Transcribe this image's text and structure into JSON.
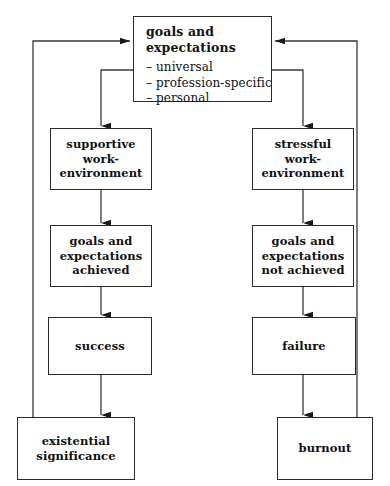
{
  "diagram": {
    "type": "flowchart",
    "width": 390,
    "height": 486,
    "colors": {
      "stroke": "#2a2a2a",
      "text": "#111111",
      "background": "#ffffff"
    },
    "nodes": [
      {
        "id": "goals-expectations",
        "title": "goals and expectations",
        "bullets": [
          "– universal",
          "– profession-specific",
          "– personal"
        ],
        "x": 133,
        "y": 16,
        "w": 139,
        "h": 86
      },
      {
        "id": "supportive-work-environment",
        "lines": [
          "supportive",
          "work-",
          "environment"
        ],
        "x": 50,
        "y": 128,
        "w": 102,
        "h": 62
      },
      {
        "id": "stressful-work-environment",
        "lines": [
          "stressful",
          "work-",
          "environment"
        ],
        "x": 252,
        "y": 128,
        "w": 102,
        "h": 62
      },
      {
        "id": "goals-achieved",
        "lines": [
          "goals and",
          "expectations",
          "achieved"
        ],
        "x": 50,
        "y": 225,
        "w": 102,
        "h": 62
      },
      {
        "id": "goals-not-achieved",
        "lines": [
          "goals and",
          "expectations",
          "not achieved"
        ],
        "x": 252,
        "y": 225,
        "w": 102,
        "h": 62
      },
      {
        "id": "success",
        "lines": [
          "success"
        ],
        "x": 48,
        "y": 317,
        "w": 104,
        "h": 58
      },
      {
        "id": "failure",
        "lines": [
          "failure"
        ],
        "x": 252,
        "y": 317,
        "w": 104,
        "h": 58
      },
      {
        "id": "existential-significance",
        "lines": [
          "existential",
          "significance"
        ],
        "x": 17,
        "y": 417,
        "w": 118,
        "h": 63
      },
      {
        "id": "burnout",
        "lines": [
          "burnout"
        ],
        "x": 277,
        "y": 417,
        "w": 96,
        "h": 63
      }
    ],
    "edges": [
      {
        "id": "goals-to-supportive",
        "from": "goals-expectations",
        "to": "supportive-work-environment",
        "arrow": true
      },
      {
        "id": "goals-to-stressful",
        "from": "goals-expectations",
        "to": "stressful-work-environment",
        "arrow": true
      },
      {
        "id": "supportive-to-achieved",
        "from": "supportive-work-environment",
        "to": "goals-achieved",
        "arrow": true
      },
      {
        "id": "stressful-to-not-achieved",
        "from": "stressful-work-environment",
        "to": "goals-not-achieved",
        "arrow": true
      },
      {
        "id": "achieved-to-success",
        "from": "goals-achieved",
        "to": "success",
        "arrow": true
      },
      {
        "id": "not-achieved-to-failure",
        "from": "goals-not-achieved",
        "to": "failure",
        "arrow": true
      },
      {
        "id": "success-to-existential",
        "from": "success",
        "to": "existential-significance",
        "arrow": true
      },
      {
        "id": "failure-to-burnout",
        "from": "failure",
        "to": "burnout",
        "arrow": true
      },
      {
        "id": "existential-feedback-to-goals",
        "from": "existential-significance",
        "to": "goals-expectations",
        "arrow": true
      },
      {
        "id": "burnout-feedback-to-goals",
        "from": "burnout",
        "to": "goals-expectations",
        "arrow": true
      }
    ]
  }
}
